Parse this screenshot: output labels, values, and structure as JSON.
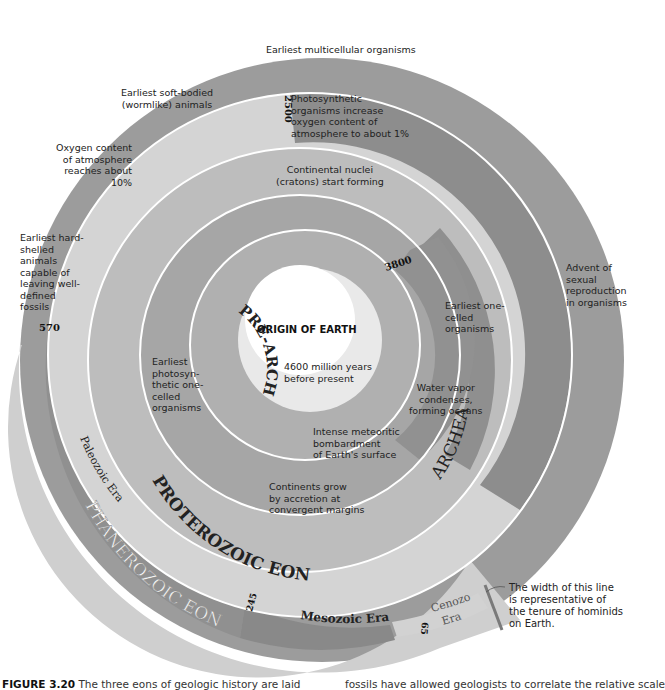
{
  "figure": {
    "caption_number": "FIGURE 3.20",
    "caption_left": "The three eons of geologic history are laid",
    "caption_right": "fossils have allowed geologists to correlate the relative scale"
  },
  "colors": {
    "pre_archean": "#a9a9a9",
    "archean": "#8e8e8e",
    "proterozoic_early": "#bdbdbd",
    "proterozoic_late": "#d6d6d6",
    "proterozoic_outer": "#9c9c9c",
    "phanerozoic": "#c8c8c8",
    "paleozoic": "#8f8f8f",
    "mesozoic": "#8a8a8a",
    "cenozoic": "#d0d0d0",
    "separator": "#ffffff"
  },
  "center": {
    "title": "ORIGIN OF EARTH",
    "subtitle": "4600 million years\nbefore present"
  },
  "eons": {
    "pre_archean": "PRE-ARCHEAN",
    "archean": "ARCHEAN EON",
    "proterozoic": "PROTEROZOIC EON",
    "phanerozoic": "PHANEROZOIC EON"
  },
  "eras": {
    "paleozoic": "Paleozoic Era",
    "mesozoic": "Mesozoic Era",
    "cenozoic_line1": "Cenozoic",
    "cenozoic_line2": "Era"
  },
  "boundaries": {
    "b3800": "3800",
    "b2500": "2500",
    "b570": "570",
    "b245": "245",
    "b65": "65"
  },
  "events": {
    "meteoritic": "Intense meteoritic\nbombardment\nof Earth's surface",
    "water_vapor": "Water vapor\ncondenses,\nforming oceans",
    "one_celled": "Earliest one-\ncelled\norganisms",
    "photosynthetic_one_celled": "Earliest\nphotosyn-\nthetic one-\ncelled\norganisms",
    "cratons": "Continental nuclei\n(cratons) start forming",
    "oxygen_1pct": "Photosynthetic\norganisms increase\noxygen content of\natmosphere to about 1%",
    "continents_grow": "Continents grow\nby accretion at\nconvergent margins",
    "sexual_reproduction": "Advent of\nsexual\nreproduction\nin organisms",
    "multicellular": "Earliest multicellular organisms",
    "soft_bodied": "Earliest soft-bodied\n(wormlike) animals",
    "oxygen_10pct": "Oxygen content\nof atmosphere\nreaches about\n10%",
    "hard_shelled": "Earliest hard-\nshelled\nanimals\ncapable of\nleaving well-\ndefined\nfossils"
  },
  "annotation": {
    "hominids": "The width of this line\nis representative of\nthe tenure of hominids\non Earth."
  }
}
